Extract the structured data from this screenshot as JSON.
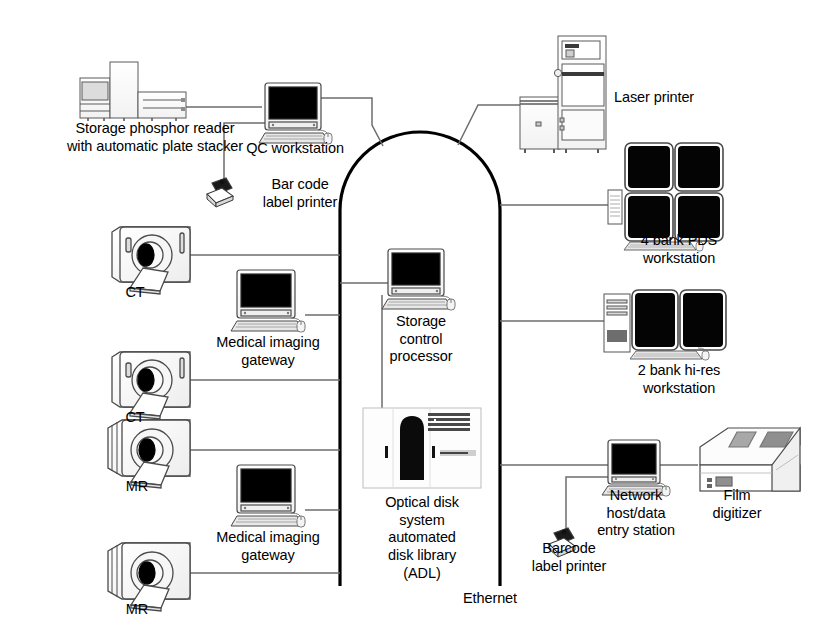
{
  "diagram": {
    "backbone_label": "Ethernet",
    "line_color": "#000000",
    "device_stroke": "#4a4a4a",
    "screen_color": "#000000",
    "background": "#ffffff"
  },
  "nodes": {
    "storage_phosphor_reader": {
      "label": "Storage phosphor reader\nwith automatic plate stacker",
      "icon": "storage-phosphor-reader-icon"
    },
    "qc_workstation": {
      "label": "QC workstation",
      "icon": "desktop-computer-icon"
    },
    "bar_code_label_printer": {
      "label": "Bar code\nlabel printer",
      "icon": "label-printer-icon"
    },
    "laser_printer": {
      "label": "Laser printer",
      "icon": "laser-printer-icon"
    },
    "pds_workstation": {
      "label": "4 bank PDS\nworkstation",
      "icon": "four-monitor-workstation-icon",
      "monitor_count": 4
    },
    "hires_workstation": {
      "label": "2 bank hi-res\nworkstation",
      "icon": "two-monitor-workstation-icon",
      "monitor_count": 2
    },
    "ct_upper": {
      "label": "CT",
      "icon": "ct-scanner-icon"
    },
    "ct_lower": {
      "label": "CT",
      "icon": "ct-scanner-icon"
    },
    "mr_upper": {
      "label": "MR",
      "icon": "mr-scanner-icon"
    },
    "mr_lower": {
      "label": "MR",
      "icon": "mr-scanner-icon"
    },
    "gateway_upper": {
      "label": "Medical imaging\ngateway",
      "icon": "desktop-computer-icon"
    },
    "gateway_lower": {
      "label": "Medical imaging\ngateway",
      "icon": "desktop-computer-icon"
    },
    "storage_control_processor": {
      "label": "Storage\ncontrol\nprocessor",
      "icon": "desktop-computer-icon"
    },
    "optical_disk_library": {
      "label": "Optical disk\nsystem\nautomated\ndisk library\n(ADL)",
      "icon": "optical-disk-library-icon"
    },
    "network_host": {
      "label": "Network\nhost/data\nentry station",
      "icon": "desktop-computer-icon"
    },
    "barcode_label_printer": {
      "label": "Barcode\nlabel printer",
      "icon": "label-printer-icon"
    },
    "film_digitizer": {
      "label": "Film\ndigitizer",
      "icon": "film-digitizer-icon"
    }
  }
}
